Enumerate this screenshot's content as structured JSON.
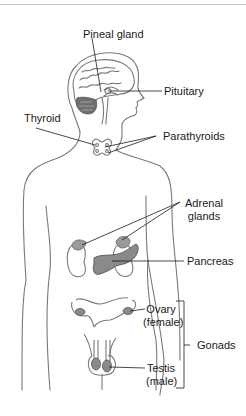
{
  "diagram": {
    "colors": {
      "outline": "#7a7a7a",
      "organ_fill": "#8a8a8a",
      "leader": "#1a1a1a",
      "text": "#1a1a1a",
      "divider": "#c8c8c8"
    },
    "labels": {
      "pineal": "Pineal gland",
      "pituitary": "Pituitary",
      "thyroid": "Thyroid",
      "parathyroids": "Parathyroids",
      "adrenal_1": "Adrenal",
      "adrenal_2": "glands",
      "pancreas": "Pancreas",
      "ovary_1": "Ovary",
      "ovary_2": "(female)",
      "testis_1": "Testis",
      "testis_2": "(male)",
      "gonads": "Gonads"
    }
  }
}
